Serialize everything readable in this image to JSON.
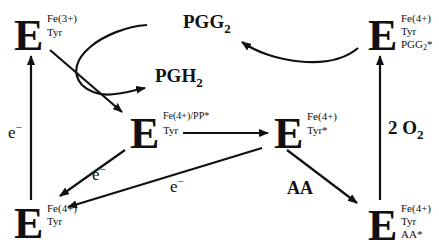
{
  "diagram": {
    "enzyme_symbol": "E",
    "nodes": {
      "top_left": {
        "sup1": "Fe(3+)",
        "sup2": "Tyr"
      },
      "top_right": {
        "sup1": "Fe(4+)",
        "sup2": "Tyr",
        "sup3": "PGG",
        "sup3_sub": "2",
        "sup3_tail": "*"
      },
      "center_left": {
        "sup1": "Fe(4+)/PP*",
        "sup2": "Tyr"
      },
      "center_right": {
        "sup1": "Fe(4+)",
        "sup2": "Tyr*"
      },
      "bottom_left": {
        "sup1": "Fe(4+)",
        "sup2": "Tyr"
      },
      "bottom_right": {
        "sup1": "Fe(4+)",
        "sup2": "Tyr",
        "sup3": "AA*"
      }
    },
    "labels": {
      "pgg2": "PGG",
      "pgg2_sub": "2",
      "pgh2": "PGH",
      "pgh2_sub": "2",
      "e_left": "e",
      "e_left_sup": "−",
      "e_mid1": "e",
      "e_mid1_sup": "−",
      "e_mid2": "e",
      "e_mid2_sup": "−",
      "aa": "AA",
      "o2_coef": "2 O",
      "o2_sub": "2"
    },
    "colors": {
      "ink": "#111111",
      "background": "#ffffff"
    }
  }
}
